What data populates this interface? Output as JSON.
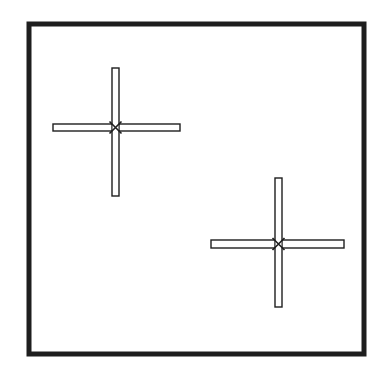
{
  "diagram": {
    "colors": {
      "background": "#ffffff",
      "stroke": "#1e1e1e",
      "fill": "#ffffff"
    },
    "frame": {
      "x": 29,
      "y": 24,
      "width": 335,
      "height": 330,
      "stroke_width": 5
    },
    "markers": [
      {
        "name": "cross-marker-1",
        "center": [
          115.5,
          127.5
        ],
        "vertical_bar": {
          "x": 112,
          "y": 68,
          "width": 7,
          "height": 128
        },
        "horizontal_bar": {
          "x": 53,
          "y": 124,
          "width": 127,
          "height": 7
        },
        "x_mark_size": 6
      },
      {
        "name": "cross-marker-2",
        "center": [
          278.5,
          244
        ],
        "vertical_bar": {
          "x": 275,
          "y": 178,
          "width": 7,
          "height": 129
        },
        "horizontal_bar": {
          "x": 211,
          "y": 240,
          "width": 133,
          "height": 8
        },
        "x_mark_size": 6
      }
    ]
  }
}
